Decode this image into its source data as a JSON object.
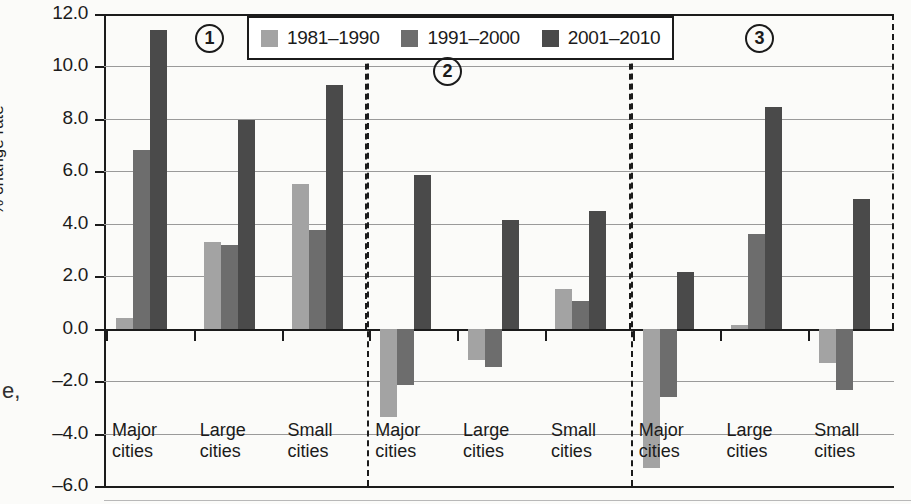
{
  "figure": {
    "stray_glyph": "e,"
  },
  "legend": {
    "position": "top-center",
    "items": [
      {
        "label": "1981–1990",
        "color": "#a3a3a3"
      },
      {
        "label": "1991–2000",
        "color": "#6d6d6d"
      },
      {
        "label": "2001–2010",
        "color": "#4a4a4a"
      }
    ]
  },
  "panels": [
    {
      "badge": "1"
    },
    {
      "badge": "2"
    },
    {
      "badge": "3"
    }
  ],
  "axes": {
    "ylabel": "% change rate",
    "yticks": [
      "12.0",
      "10.0",
      "8.0",
      "6.0",
      "4.0",
      "2.0",
      "0.0",
      "–2.0",
      "–4.0",
      "–6.0"
    ],
    "ytick_values": [
      12.0,
      10.0,
      8.0,
      6.0,
      4.0,
      2.0,
      0.0,
      -2.0,
      -4.0,
      -6.0
    ],
    "categories": [
      "Major cities",
      "Large cities",
      "Small cities"
    ],
    "category_lines": [
      [
        "Major",
        "cities"
      ],
      [
        "Large",
        "cities"
      ],
      [
        "Small",
        "cities"
      ]
    ]
  },
  "chart_data": {
    "type": "bar",
    "title": "",
    "xlabel": "",
    "ylabel": "% change rate",
    "ylim": [
      -6.0,
      12.0
    ],
    "ytick_step": 2.0,
    "grid": true,
    "legend_position": "top-center",
    "panel_labels": [
      "1",
      "2",
      "3"
    ],
    "categories": [
      "Major cities",
      "Large cities",
      "Small cities"
    ],
    "series_names": [
      "1981–1990",
      "1991–2000",
      "2001–2010"
    ],
    "series_colors": [
      "#a3a3a3",
      "#6d6d6d",
      "#4a4a4a"
    ],
    "panels": [
      {
        "label": "1",
        "categories": [
          "Major cities",
          "Large cities",
          "Small cities"
        ],
        "series": [
          {
            "name": "1981–1990",
            "values": [
              0.4,
              3.3,
              5.5
            ]
          },
          {
            "name": "1991–2000",
            "values": [
              6.8,
              3.2,
              3.75
            ]
          },
          {
            "name": "2001–2010",
            "values": [
              11.4,
              7.95,
              9.3
            ]
          }
        ]
      },
      {
        "label": "2",
        "categories": [
          "Major cities",
          "Large cities",
          "Small cities"
        ],
        "series": [
          {
            "name": "1981–1990",
            "values": [
              -3.35,
              -1.2,
              1.5
            ]
          },
          {
            "name": "1991–2000",
            "values": [
              -2.15,
              -1.45,
              1.05
            ]
          },
          {
            "name": "2001–2010",
            "values": [
              5.85,
              4.15,
              4.5
            ]
          }
        ]
      },
      {
        "label": "3",
        "categories": [
          "Major cities",
          "Large cities",
          "Small cities"
        ],
        "series": [
          {
            "name": "1981–1990",
            "values": [
              -5.3,
              0.15,
              -1.3
            ]
          },
          {
            "name": "1991–2000",
            "values": [
              -2.6,
              3.6,
              -2.35
            ]
          },
          {
            "name": "2001–2010",
            "values": [
              2.15,
              8.45,
              4.95
            ]
          }
        ]
      }
    ]
  }
}
